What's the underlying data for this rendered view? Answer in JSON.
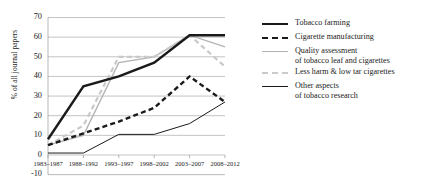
{
  "chart_data": {
    "type": "line",
    "title": "",
    "xlabel": "",
    "ylabel": "% of all journal papers",
    "categories": [
      "1983–1987",
      "1988–1992",
      "1993–1997",
      "1998–2002",
      "2003–2007",
      "2008–2012"
    ],
    "ylim": [
      -10,
      70
    ],
    "ytick_values": [
      70,
      60,
      50,
      40,
      30,
      20,
      10,
      0,
      -10
    ],
    "ytick_labels": [
      "70",
      "60",
      "50",
      "40",
      "30",
      "20",
      "10",
      "0",
      "-10"
    ],
    "grid": "horizontal",
    "legend_position": "right",
    "series": [
      {
        "name": "Tobacco farming",
        "style": "solid-thick",
        "color": "#1a1a1a",
        "values": [
          8,
          35,
          40,
          47,
          61,
          61
        ]
      },
      {
        "name": "Cigarette manufacturing",
        "style": "dash-thick",
        "color": "#1a1a1a",
        "values": [
          5,
          11,
          17,
          24,
          40,
          27
        ]
      },
      {
        "name": "Quality assessment\nof tobacco leaf and cigarettes",
        "style": "solid-gray",
        "color": "#b3b3b3",
        "values": [
          5,
          10,
          47,
          50,
          61,
          55
        ]
      },
      {
        "name": "Less harm & low tar cigarettes",
        "style": "dash-gray",
        "color": "#c9c9c9",
        "values": [
          5,
          15,
          50,
          50,
          61,
          45
        ]
      },
      {
        "name": "Other aspects\nof tobacco research",
        "style": "solid-thin",
        "color": "#1a1a1a",
        "values": [
          1,
          1,
          10.5,
          10.5,
          16,
          27
        ]
      }
    ]
  },
  "legend": {
    "items": [
      {
        "label": "Tobacco farming",
        "swatch": "solid-thick"
      },
      {
        "label": "Cigarette manufacturing",
        "swatch": "dash-thick"
      },
      {
        "label": "Quality assessment\nof tobacco leaf and cigarettes",
        "swatch": "solid-gray"
      },
      {
        "label": "Less harm & low tar cigarettes",
        "swatch": "dash-gray"
      },
      {
        "label": "Other aspects\nof tobacco research",
        "swatch": "solid-thin"
      }
    ]
  }
}
